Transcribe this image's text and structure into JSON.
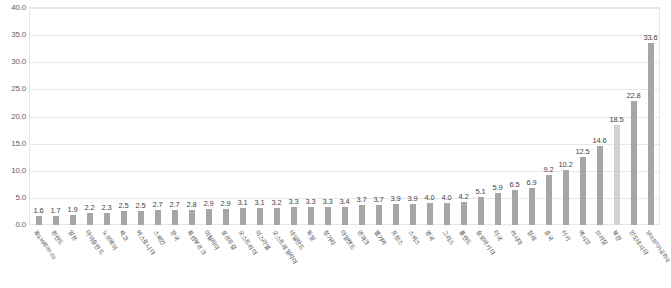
{
  "title": {
    "text": "",
    "note": "cut-off faint header text at top edge"
  },
  "chart_data": {
    "type": "bar",
    "title": "",
    "subtitle": "",
    "xlabel": "",
    "ylabel": "",
    "ylim": [
      0,
      40
    ],
    "grid": true,
    "legend": "none",
    "y_ticks": [
      "0.0",
      "5.0",
      "10.0",
      "15.0",
      "20.0",
      "25.0",
      "30.0",
      "35.0",
      "40.0"
    ],
    "y_tick_values": [
      0,
      5,
      10,
      15,
      20,
      25,
      30,
      35,
      40
    ],
    "bar_color": "#a6a6a6",
    "bar_color_highlight": "#d2d2d2",
    "categories": [
      "몰도바/루마니아",
      "핀란드",
      "일본",
      "아이슬란드",
      "노르웨이",
      "체코",
      "에스토니아",
      "스페인",
      "한국",
      "룩셈부르크",
      "이탈리아",
      "포르투갈",
      "오스트리아",
      "이스라엘",
      "오스트레일리아",
      "네덜란드",
      "독일",
      "헝가리",
      "아일랜드",
      "덴마크",
      "벨기에",
      "프랑스",
      "스위스",
      "영국",
      "그리스",
      "폴란드",
      "슬로바키아",
      "미국",
      "러시아",
      "칠레",
      "중국",
      "터키",
      "멕시코",
      "브라질",
      "북한",
      "인도네시아",
      "남아프리카공화국"
    ],
    "labels": [
      "1.6",
      "1.7",
      "1.9",
      "2.2",
      "2.3",
      "2.5",
      "2.5",
      "2.7",
      "2.7",
      "2.8",
      "2.9",
      "2.9",
      "3.1",
      "3.1",
      "3.2",
      "3.3",
      "3.3",
      "3.3",
      "3.4",
      "3.7",
      "3.7",
      "3.9",
      "3.9",
      "4.0",
      "4.0",
      "4.2",
      "5.1",
      "5.9",
      "6.5",
      "6.9",
      "9.2",
      "10.2",
      "12.5",
      "14.6",
      "18.5",
      "22.8",
      "33.6"
    ],
    "values": [
      1.6,
      1.7,
      1.9,
      2.2,
      2.3,
      2.5,
      2.5,
      2.7,
      2.7,
      2.8,
      2.9,
      2.9,
      3.1,
      3.1,
      3.2,
      3.3,
      3.3,
      3.3,
      3.4,
      3.7,
      3.7,
      3.9,
      3.9,
      4.0,
      4.0,
      4.2,
      5.1,
      5.9,
      6.5,
      6.9,
      9.2,
      10.2,
      12.5,
      14.6,
      18.5,
      22.8,
      33.6
    ],
    "highlight_indices": [
      34
    ]
  }
}
